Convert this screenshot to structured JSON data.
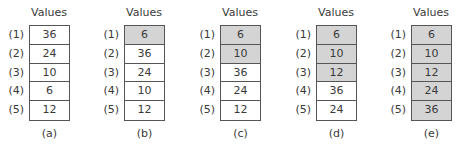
{
  "column_header": "Values",
  "row_indices": [
    "(1)",
    "(2)",
    "(3)",
    "(4)",
    "(5)"
  ],
  "colors": {
    "shaded": "#d4d4d4",
    "unshaded": "#ffffff",
    "border": "#555555"
  },
  "panels": [
    {
      "caption": "(a)",
      "values": [
        "36",
        "24",
        "10",
        "6",
        "12"
      ],
      "shaded_rows": 0
    },
    {
      "caption": "(b)",
      "values": [
        "6",
        "36",
        "24",
        "10",
        "12"
      ],
      "shaded_rows": 1
    },
    {
      "caption": "(c)",
      "values": [
        "6",
        "10",
        "36",
        "24",
        "12"
      ],
      "shaded_rows": 2
    },
    {
      "caption": "(d)",
      "values": [
        "6",
        "10",
        "12",
        "36",
        "24"
      ],
      "shaded_rows": 3
    },
    {
      "caption": "(e)",
      "values": [
        "6",
        "10",
        "12",
        "24",
        "36"
      ],
      "shaded_rows": 5
    }
  ]
}
